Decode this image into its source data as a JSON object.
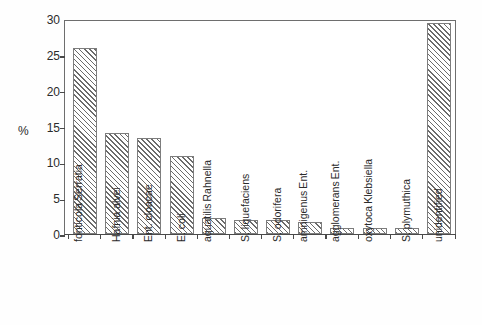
{
  "chart_data": {
    "type": "bar",
    "title": "",
    "subtitle": "",
    "xlabel": "",
    "ylabel": "%",
    "ylim": [
      0,
      30
    ],
    "yticks": [
      0,
      5,
      10,
      15,
      20,
      25,
      30
    ],
    "ytick_labels": [
      "0",
      "5",
      "10",
      "15",
      "20",
      "25",
      "30"
    ],
    "grid": false,
    "legend": null,
    "bar_fill": "diagonal-hatch",
    "bar_edge_color": "#7d7d7d",
    "hatch_color": "#6b6b6b",
    "categories": [
      "Serratia fonticola",
      "Hafnia alvei",
      "Ent. cloacae",
      "E. coli",
      "Rahnella aquatilis",
      "S. liquefaciens",
      "S. odorifera",
      "Ent. amnigenus",
      "Ent. agglomerans",
      "Klebsiella oxytoca",
      "S. plymuthica",
      "unidentified"
    ],
    "category_lines": [
      [
        "Serratia",
        "fonticola"
      ],
      [
        "Hafnia alvei"
      ],
      [
        "Ent. cloacae"
      ],
      [
        "E. coli"
      ],
      [
        "Rahnella",
        "aquatilis"
      ],
      [
        "S. liquefaciens"
      ],
      [
        "S. odorifera"
      ],
      [
        "Ent.",
        "amnigenus"
      ],
      [
        "Ent.",
        "agglomerans"
      ],
      [
        "Klebsiella",
        "oxytoca"
      ],
      [
        "S. plymuthica"
      ],
      [
        "unidentified"
      ]
    ],
    "values": [
      26.0,
      14.1,
      13.4,
      10.9,
      2.2,
      2.0,
      2.0,
      1.7,
      0.85,
      0.85,
      0.9,
      29.4
    ]
  }
}
